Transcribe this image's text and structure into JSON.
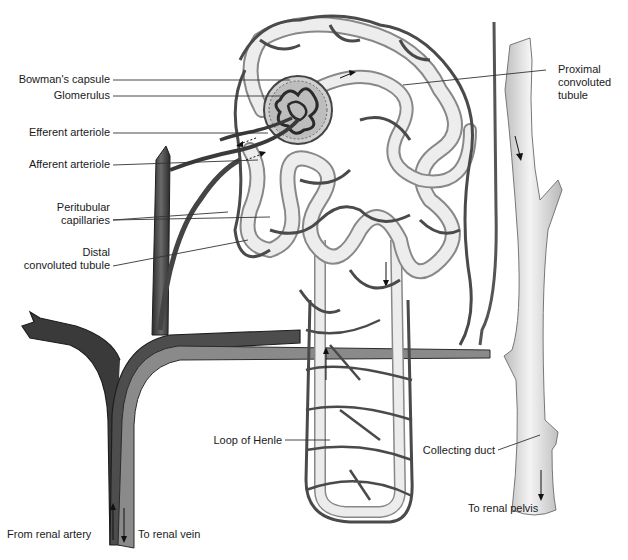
{
  "diagram": {
    "colors": {
      "vessel_dark": "#4a4a4a",
      "vessel_outline": "#2a2a2a",
      "tubule_fill": "#e6e6e6",
      "tubule_outline": "#8a8a8a",
      "label_text": "#1a1a1a",
      "leader_line": "#333333",
      "background": "#ffffff"
    },
    "labels": {
      "bowmans_capsule": "Bowman's capsule",
      "glomerulus": "Glomerulus",
      "efferent_arteriole": "Efferent arteriole",
      "afferent_arteriole": "Afferent arteriole",
      "peritubular_line1": "Peritubular",
      "peritubular_line2": "capillaries",
      "distal_line1": "Distal",
      "distal_line2": "convoluted tubule",
      "proximal_line1": "Proximal",
      "proximal_line2": "convoluted",
      "proximal_line3": "tubule",
      "loop_of_henle": "Loop of Henle",
      "collecting_duct": "Collecting duct",
      "from_renal_artery": "From renal artery",
      "to_renal_vein": "To renal vein",
      "to_renal_pelvis": "To renal pelvis"
    }
  }
}
